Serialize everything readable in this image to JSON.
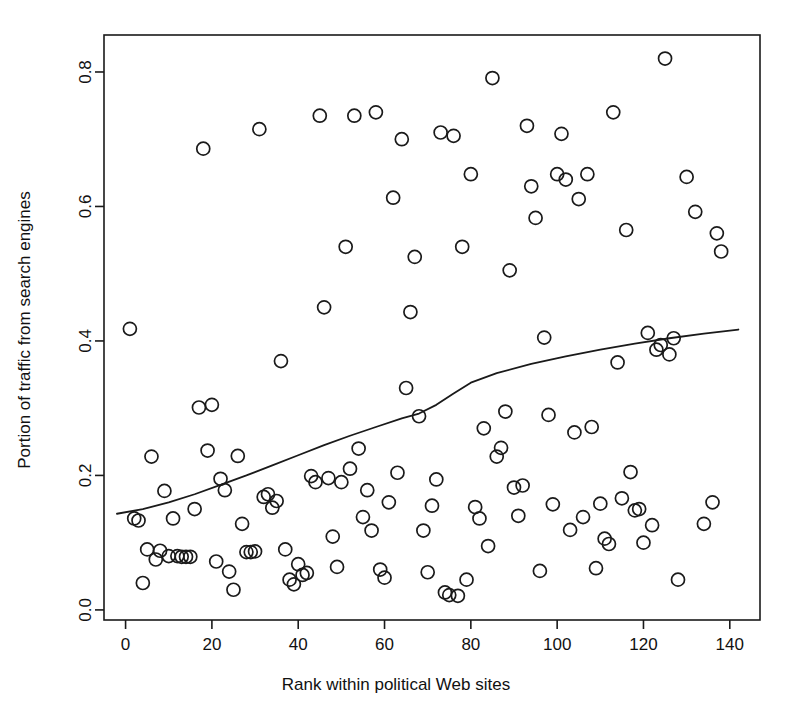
{
  "figure": {
    "background_color": "#ffffff",
    "foreground_color": "#1a1a1a"
  },
  "chart_data": {
    "type": "scatter",
    "title": "",
    "xlabel": "Rank within political Web sites",
    "ylabel": "Portion of traffic from search engines",
    "xlim": [
      -5,
      147
    ],
    "ylim": [
      -0.015,
      0.855
    ],
    "xticks": [
      0,
      20,
      40,
      60,
      80,
      100,
      120,
      140
    ],
    "xtick_labels": [
      "0",
      "20",
      "40",
      "60",
      "80",
      "100",
      "120",
      "140"
    ],
    "yticks": [
      0.0,
      0.2,
      0.4,
      0.6,
      0.8
    ],
    "ytick_labels": [
      "0.0",
      "0.2",
      "0.4",
      "0.6",
      "0.8"
    ],
    "grid": false,
    "legend": null,
    "marker": "open-circle",
    "marker_size": 7,
    "points": [
      [
        1,
        0.418
      ],
      [
        2,
        0.136
      ],
      [
        3,
        0.133
      ],
      [
        4,
        0.04
      ],
      [
        5,
        0.09
      ],
      [
        6,
        0.228
      ],
      [
        7,
        0.075
      ],
      [
        8,
        0.088
      ],
      [
        9,
        0.177
      ],
      [
        10,
        0.08
      ],
      [
        11,
        0.136
      ],
      [
        12,
        0.08
      ],
      [
        13,
        0.079
      ],
      [
        14,
        0.079
      ],
      [
        15,
        0.079
      ],
      [
        16,
        0.15
      ],
      [
        17,
        0.301
      ],
      [
        18,
        0.686
      ],
      [
        19,
        0.237
      ],
      [
        20,
        0.305
      ],
      [
        21,
        0.072
      ],
      [
        22,
        0.195
      ],
      [
        23,
        0.178
      ],
      [
        24,
        0.057
      ],
      [
        25,
        0.03
      ],
      [
        26,
        0.229
      ],
      [
        27,
        0.128
      ],
      [
        28,
        0.086
      ],
      [
        29,
        0.086
      ],
      [
        30,
        0.087
      ],
      [
        31,
        0.715
      ],
      [
        32,
        0.168
      ],
      [
        33,
        0.172
      ],
      [
        34,
        0.152
      ],
      [
        35,
        0.162
      ],
      [
        36,
        0.37
      ],
      [
        37,
        0.09
      ],
      [
        38,
        0.045
      ],
      [
        39,
        0.038
      ],
      [
        40,
        0.068
      ],
      [
        41,
        0.052
      ],
      [
        42,
        0.055
      ],
      [
        43,
        0.199
      ],
      [
        44,
        0.19
      ],
      [
        45,
        0.735
      ],
      [
        46,
        0.45
      ],
      [
        47,
        0.196
      ],
      [
        48,
        0.109
      ],
      [
        49,
        0.064
      ],
      [
        50,
        0.19
      ],
      [
        51,
        0.54
      ],
      [
        52,
        0.21
      ],
      [
        53,
        0.735
      ],
      [
        54,
        0.24
      ],
      [
        55,
        0.138
      ],
      [
        56,
        0.178
      ],
      [
        57,
        0.118
      ],
      [
        58,
        0.74
      ],
      [
        59,
        0.06
      ],
      [
        60,
        0.048
      ],
      [
        61,
        0.16
      ],
      [
        62,
        0.613
      ],
      [
        63,
        0.204
      ],
      [
        64,
        0.7
      ],
      [
        65,
        0.33
      ],
      [
        66,
        0.443
      ],
      [
        67,
        0.525
      ],
      [
        68,
        0.288
      ],
      [
        69,
        0.118
      ],
      [
        70,
        0.056
      ],
      [
        71,
        0.155
      ],
      [
        72,
        0.194
      ],
      [
        73,
        0.71
      ],
      [
        74,
        0.026
      ],
      [
        75,
        0.022
      ],
      [
        76,
        0.705
      ],
      [
        77,
        0.021
      ],
      [
        78,
        0.54
      ],
      [
        79,
        0.045
      ],
      [
        80,
        0.648
      ],
      [
        81,
        0.153
      ],
      [
        82,
        0.136
      ],
      [
        83,
        0.27
      ],
      [
        84,
        0.095
      ],
      [
        85,
        0.791
      ],
      [
        86,
        0.228
      ],
      [
        87,
        0.241
      ],
      [
        88,
        0.295
      ],
      [
        89,
        0.505
      ],
      [
        90,
        0.182
      ],
      [
        91,
        0.14
      ],
      [
        92,
        0.185
      ],
      [
        93,
        0.72
      ],
      [
        94,
        0.63
      ],
      [
        95,
        0.583
      ],
      [
        96,
        0.058
      ],
      [
        97,
        0.405
      ],
      [
        98,
        0.29
      ],
      [
        99,
        0.157
      ],
      [
        100,
        0.648
      ],
      [
        101,
        0.708
      ],
      [
        102,
        0.64
      ],
      [
        103,
        0.119
      ],
      [
        104,
        0.264
      ],
      [
        105,
        0.611
      ],
      [
        106,
        0.138
      ],
      [
        107,
        0.648
      ],
      [
        108,
        0.272
      ],
      [
        109,
        0.062
      ],
      [
        110,
        0.158
      ],
      [
        111,
        0.106
      ],
      [
        112,
        0.098
      ],
      [
        113,
        0.74
      ],
      [
        114,
        0.368
      ],
      [
        115,
        0.166
      ],
      [
        116,
        0.565
      ],
      [
        117,
        0.205
      ],
      [
        118,
        0.148
      ],
      [
        119,
        0.15
      ],
      [
        120,
        0.1
      ],
      [
        121,
        0.412
      ],
      [
        122,
        0.126
      ],
      [
        123,
        0.387
      ],
      [
        124,
        0.394
      ],
      [
        125,
        0.82
      ],
      [
        126,
        0.38
      ],
      [
        127,
        0.404
      ],
      [
        128,
        0.045
      ],
      [
        130,
        0.644
      ],
      [
        132,
        0.592
      ],
      [
        134,
        0.128
      ],
      [
        136,
        0.16
      ],
      [
        137,
        0.56
      ],
      [
        138,
        0.533
      ]
    ],
    "fit_line": {
      "style": "loess-smooth",
      "color": "#1a1a1a",
      "points": [
        [
          -2,
          0.143
        ],
        [
          4,
          0.15
        ],
        [
          10,
          0.16
        ],
        [
          16,
          0.172
        ],
        [
          22,
          0.186
        ],
        [
          28,
          0.2
        ],
        [
          34,
          0.215
        ],
        [
          40,
          0.23
        ],
        [
          46,
          0.245
        ],
        [
          52,
          0.259
        ],
        [
          58,
          0.272
        ],
        [
          64,
          0.285
        ],
        [
          68,
          0.292
        ],
        [
          72,
          0.305
        ],
        [
          76,
          0.322
        ],
        [
          80,
          0.338
        ],
        [
          86,
          0.352
        ],
        [
          94,
          0.366
        ],
        [
          102,
          0.377
        ],
        [
          110,
          0.387
        ],
        [
          118,
          0.396
        ],
        [
          126,
          0.404
        ],
        [
          134,
          0.411
        ],
        [
          142,
          0.417
        ]
      ]
    }
  }
}
